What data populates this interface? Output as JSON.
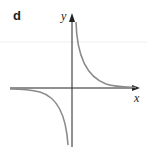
{
  "figure": {
    "panel_label": "d",
    "x_axis_label": "x",
    "y_axis_label": "y",
    "curve": "hyperbola y = k/x (k > 0), branches in quadrants I and III",
    "colors": {
      "axes": "#222222",
      "curve": "#8a8a8a",
      "guide_line": "#eeeeee"
    }
  }
}
